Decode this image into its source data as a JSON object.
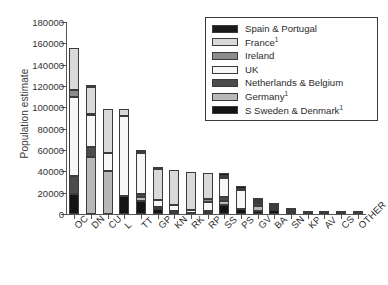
{
  "chart_data": {
    "type": "bar",
    "subtype": "stacked-vertical",
    "title": "",
    "xlabel": "",
    "ylabel": "Population estimate",
    "ylim": [
      0,
      180000
    ],
    "ytick_step": 20000,
    "yticks": [
      0,
      20000,
      40000,
      60000,
      80000,
      100000,
      120000,
      140000,
      160000,
      180000
    ],
    "ytick_labels": [
      "0",
      "20000",
      "40000",
      "60000",
      "80000",
      "100000",
      "120000",
      "140000",
      "160000",
      "180000"
    ],
    "grid": false,
    "legend_position": "upper-right",
    "categories": [
      "OC",
      "DN",
      "CU",
      "L",
      "TT",
      "GP",
      "KN",
      "RK",
      "RP",
      "SS",
      "PS",
      "GV",
      "BA",
      "SN",
      "KP",
      "AV",
      "CS",
      "OTHER"
    ],
    "series": [
      {
        "name": "Spain & Portugal",
        "color": "#1a1a1a",
        "values": [
          0,
          1000,
          0,
          0,
          1500,
          400,
          0,
          0,
          0,
          2000,
          2500,
          600,
          300,
          0,
          0,
          0,
          0,
          0
        ]
      },
      {
        "name": "France",
        "footnote": "1",
        "color": "#d9d9d9",
        "values": [
          39500,
          25500,
          41000,
          6500,
          1000,
          29500,
          33000,
          35500,
          24500,
          2500,
          1000,
          1800,
          800,
          300,
          200,
          150,
          150,
          0
        ]
      },
      {
        "name": "Ireland",
        "color": "#8c8c8c",
        "values": [
          6500,
          1500,
          0,
          0,
          500,
          0,
          0,
          0,
          2500,
          0,
          0,
          0,
          0,
          0,
          0,
          0,
          0,
          0
        ]
      },
      {
        "name": "UK",
        "color": "#f7f7f7",
        "values": [
          74500,
          29500,
          17000,
          74500,
          38000,
          6500,
          5500,
          2500,
          8500,
          17500,
          17500,
          1500,
          800,
          200,
          100,
          100,
          100,
          1500
        ]
      },
      {
        "name": "Netherlands & Belgium",
        "color": "#4c4c4c",
        "values": [
          16500,
          10000,
          0,
          0,
          3500,
          0,
          0,
          0,
          0,
          3500,
          0,
          2500,
          1000,
          0,
          0,
          0,
          0,
          0
        ]
      },
      {
        "name": "Germany",
        "footnote": "1",
        "color": "#b8b8b8",
        "values": [
          0,
          53000,
          40000,
          0,
          3500,
          1500,
          1000,
          0,
          2500,
          4000,
          0,
          5000,
          2000,
          2700,
          700,
          400,
          400,
          500
        ]
      },
      {
        "name": "S Sweden & Denmark",
        "footnote": "1",
        "color": "#141414",
        "values": [
          19000,
          0,
          0,
          17000,
          12000,
          5000,
          1500,
          1000,
          700,
          8500,
          5000,
          2500,
          3500,
          500,
          300,
          200,
          200,
          600
        ]
      }
    ],
    "totals": [
      156000,
      120500,
      98000,
      98000,
      60000,
      42900,
      41000,
      39000,
      38700,
      38000,
      26000,
      13900,
      8400,
      3700,
      1300,
      850,
      850,
      2600
    ]
  },
  "legend": {
    "items": [
      {
        "label": "Spain & Portugal",
        "sup": ""
      },
      {
        "label": "France",
        "sup": "1"
      },
      {
        "label": "Ireland",
        "sup": ""
      },
      {
        "label": "UK",
        "sup": ""
      },
      {
        "label": "Netherlands & Belgium",
        "sup": ""
      },
      {
        "label": "Germany",
        "sup": "1"
      },
      {
        "label": "S Sweden & Denmark",
        "sup": "1"
      }
    ]
  }
}
